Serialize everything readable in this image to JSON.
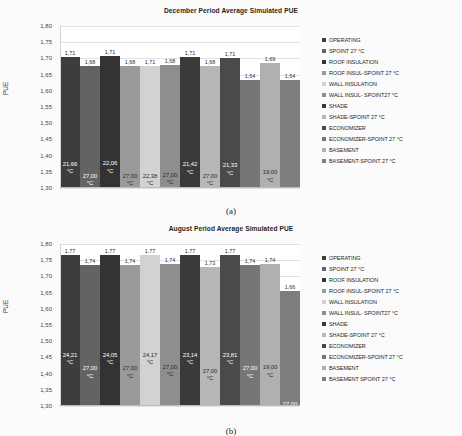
{
  "figures": [
    {
      "caption": "(a)",
      "title": "December Period Average Simulated PUE",
      "ylabel": "PUE",
      "yticks": [
        "1,80",
        "1,75",
        "1,70",
        "1,65",
        "1,60",
        "1,55",
        "1,50",
        "1,45",
        "1,40",
        "1,35",
        "1,30"
      ],
      "ylim": [
        1.3,
        1.8
      ],
      "bars": [
        {
          "name": "OPERATING",
          "value": "1,71",
          "v": 1.705,
          "temp": "21,66",
          "unit": "°C",
          "color": "#3d3d3d",
          "textColor": "#ffffff"
        },
        {
          "name": "SPOINT 27 °C",
          "value": "1,68",
          "v": 1.678,
          "temp": "27,00",
          "unit": "°C",
          "color": "#636363",
          "textColor": "#ffffff"
        },
        {
          "name": "ROOF INSULATION",
          "value": "1,71",
          "v": 1.706,
          "temp": "22,06",
          "unit": "°C",
          "color": "#333333",
          "textColor": "#ffffff"
        },
        {
          "name": "ROOF INSUL-SPOINT 27 °C",
          "value": "1,68",
          "v": 1.678,
          "temp": "27,00",
          "unit": "°C",
          "color": "#9a9a9a",
          "textColor": "#2b2b2b"
        },
        {
          "name": "WALL INSULATION",
          "value": "1,71",
          "v": 1.678,
          "temp": "22,38",
          "unit": "°C",
          "color": "#d2d2d2",
          "textColor": "#2b2b2b"
        },
        {
          "name": "WALL INSUL- SPOINT27 °C",
          "value": "1,68",
          "v": 1.68,
          "temp": "27,00",
          "unit": "°C",
          "color": "#8e8e8e",
          "textColor": "#2b2b2b"
        },
        {
          "name": "SHADE",
          "value": "1,71",
          "v": 1.704,
          "temp": "21,42",
          "unit": "°C",
          "color": "#3a3a3a",
          "textColor": "#ffffff"
        },
        {
          "name": "SHADE-SPOINT 27 °C",
          "value": "1,68",
          "v": 1.678,
          "temp": "27,00",
          "unit": "°C",
          "color": "#b7b7b7",
          "textColor": "#2b2b2b"
        },
        {
          "name": "ECONOMIZER",
          "value": "1,71",
          "v": 1.702,
          "temp": "21,33",
          "unit": "°C",
          "color": "#4a4a4a",
          "textColor": "#ffffff"
        },
        {
          "name": "ECONOMIZER-SPOINT 27 °C",
          "value": "1,64",
          "v": 1.634,
          "temp": "27,00",
          "unit": "°C",
          "color": "#767676",
          "textColor": "#ffffff"
        },
        {
          "name": "BASEMENT",
          "value": "1,69",
          "v": 1.686,
          "temp": "19,00",
          "unit": "°C",
          "color": "#b0b0b0",
          "textColor": "#2b2b2b"
        },
        {
          "name": "BASEMENT-SPOINT 27 °C",
          "value": "1,64",
          "v": 1.634,
          "temp": "27,00",
          "unit": "°C",
          "color": "#7d7d7d",
          "textColor": "#ffffff"
        }
      ]
    },
    {
      "caption": "(b)",
      "title": "August Period Average Simulated PUE",
      "ylabel": "PUE",
      "yticks": [
        "1,80",
        "1,75",
        "1,70",
        "1,65",
        "1,60",
        "1,55",
        "1,50",
        "1,45",
        "1,40",
        "1,35",
        "1,30"
      ],
      "ylim": [
        1.3,
        1.8
      ],
      "bars": [
        {
          "name": "OPERATING",
          "value": "1,77",
          "v": 1.766,
          "temp": "24,21",
          "unit": "°C",
          "color": "#3d3d3d",
          "textColor": "#ffffff"
        },
        {
          "name": "SPOINT 27 °C",
          "value": "1,74",
          "v": 1.735,
          "temp": "27,00",
          "unit": "°C",
          "color": "#636363",
          "textColor": "#ffffff"
        },
        {
          "name": "ROOF INSULATION",
          "value": "1,77",
          "v": 1.766,
          "temp": "24,05",
          "unit": "°C",
          "color": "#333333",
          "textColor": "#ffffff"
        },
        {
          "name": "ROOF INSUL-SPOINT 27 °C",
          "value": "1,74",
          "v": 1.735,
          "temp": "27,00",
          "unit": "°C",
          "color": "#9a9a9a",
          "textColor": "#2b2b2b"
        },
        {
          "name": "WALL INSULATION",
          "value": "1,77",
          "v": 1.766,
          "temp": "24,17",
          "unit": "°C",
          "color": "#d2d2d2",
          "textColor": "#2b2b2b"
        },
        {
          "name": "WALL INSUL- SPOINT27 °C",
          "value": "1,74",
          "v": 1.739,
          "temp": "27,00",
          "unit": "°C",
          "color": "#8e8e8e",
          "textColor": "#2b2b2b"
        },
        {
          "name": "SHADE",
          "value": "1,77",
          "v": 1.766,
          "temp": "23,14",
          "unit": "°C",
          "color": "#3a3a3a",
          "textColor": "#ffffff"
        },
        {
          "name": "SHADE-SPOINT 27 °C",
          "value": "1,73",
          "v": 1.73,
          "temp": "27,00",
          "unit": "°C",
          "color": "#b7b7b7",
          "textColor": "#2b2b2b"
        },
        {
          "name": "ECONOMIZER",
          "value": "1,77",
          "v": 1.766,
          "temp": "23,81",
          "unit": "°C",
          "color": "#4a4a4a",
          "textColor": "#ffffff"
        },
        {
          "name": "ECONOMIZER-SPOINT 27 °C",
          "value": "1,74",
          "v": 1.735,
          "temp": "27,00",
          "unit": "°C",
          "color": "#767676",
          "textColor": "#ffffff"
        },
        {
          "name": "BASEMENT",
          "value": "1,74",
          "v": 1.738,
          "temp": "19,00",
          "unit": "°C",
          "color": "#b0b0b0",
          "textColor": "#2b2b2b"
        },
        {
          "name": "BASEMENT-SPOINT 27 °C",
          "value": "1,66",
          "v": 1.656,
          "temp": "27,00",
          "unit": "°C",
          "color": "#7d7d7d",
          "textColor": "#ffffff"
        }
      ]
    }
  ],
  "chart_data": [
    {
      "type": "bar",
      "title": "December Period Average Simulated PUE",
      "xlabel": "",
      "ylabel": "PUE",
      "ylim": [
        1.3,
        1.8
      ],
      "ytick_step": 0.05,
      "grid": true,
      "legend_position": "right",
      "categories": [
        "OPERATING",
        "SPOINT 27 °C",
        "ROOF INSULATION",
        "ROOF INSUL-SPOINT 27 °C",
        "WALL INSULATION",
        "WALL INSUL- SPOINT27 °C",
        "SHADE",
        "SHADE-SPOINT 27 °C",
        "ECONOMIZER",
        "ECONOMIZER-SPOINT 27 °C",
        "BASEMENT",
        "BASEMENT-SPOINT 27 °C"
      ],
      "values": [
        1.71,
        1.68,
        1.71,
        1.68,
        1.71,
        1.68,
        1.71,
        1.68,
        1.71,
        1.64,
        1.69,
        1.64
      ],
      "data_labels": [
        "1,71",
        "1,68",
        "1,71",
        "1,68",
        "1,71",
        "1,68",
        "1,71",
        "1,68",
        "1,71",
        "1,64",
        "1,69",
        "1,64"
      ],
      "annotations_inside_bars": [
        "21,66 °C",
        "27,00 °C",
        "22,06 °C",
        "27,00 °C",
        "22,38 °C",
        "27,00 °C",
        "21,42 °C",
        "27,00 °C",
        "21,33 °C",
        "27,00 °C",
        "19,00 °C",
        "27,00 °C"
      ],
      "caption": "(a)"
    },
    {
      "type": "bar",
      "title": "August Period Average Simulated PUE",
      "xlabel": "",
      "ylabel": "PUE",
      "ylim": [
        1.3,
        1.8
      ],
      "ytick_step": 0.05,
      "grid": true,
      "legend_position": "right",
      "categories": [
        "OPERATING",
        "SPOINT 27 °C",
        "ROOF INSULATION",
        "ROOF INSUL-SPOINT 27 °C",
        "WALL INSULATION",
        "WALL INSUL- SPOINT27 °C",
        "SHADE",
        "SHADE-SPOINT 27 °C",
        "ECONOMIZER",
        "ECONOMIZER-SPOINT 27 °C",
        "BASEMENT",
        "BASEMENT SPOINT 27 °C"
      ],
      "values": [
        1.77,
        1.74,
        1.77,
        1.74,
        1.77,
        1.74,
        1.77,
        1.73,
        1.77,
        1.74,
        1.74,
        1.66
      ],
      "data_labels": [
        "1,77",
        "1,74",
        "1,77",
        "1,74",
        "1,77",
        "1,74",
        "1,77",
        "1,73",
        "1,77",
        "1,74",
        "1,74",
        "1,66"
      ],
      "annotations_inside_bars": [
        "24,21 °C",
        "27,00 °C",
        "24,05 °C",
        "27,00 °C",
        "24,17 °C",
        "27,00 °C",
        "23,14 °C",
        "27,00 °C",
        "23,81 °C",
        "27,00 °C",
        "19,00 °C",
        "27,00 °C"
      ],
      "caption": "(b)"
    }
  ],
  "legends": [
    [
      "OPERATING",
      "SPOINT 27 °C",
      "ROOF INSULATION",
      "ROOF INSUL-SPOINT 27 °C",
      "WALL INSULATION",
      "WALL INSUL- SPOINT27 °C",
      "SHADE",
      "SHADE-SPOINT 27 °C",
      "ECONOMIZER",
      "ECONOMIZER-SPOINT 27 °C",
      "BASEMENT",
      "BASEMENT-SPOINT 27 °C"
    ],
    [
      "OPERATING",
      "SPOINT 27 °C",
      "ROOF INSULATION",
      "ROOF INSUL-SPOINT 27 °C",
      "WALL INSULATION",
      "WALL INSUL- SPOINT27 °C",
      "SHADE",
      "SHADE-SPOINT 27 °C",
      "ECONOMIZER",
      "ECONOMIZER-SPOINT 27 °C",
      "BASEMENT",
      "BASEMENT SPOINT 27 °C"
    ]
  ]
}
